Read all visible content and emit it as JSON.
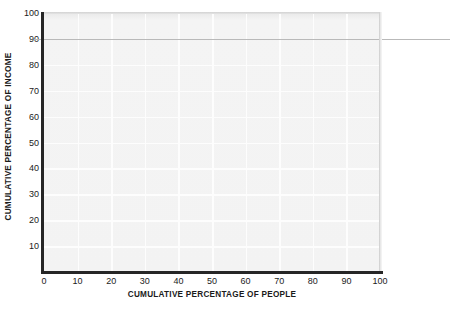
{
  "chart_data": {
    "type": "line",
    "title": "",
    "subtitle": "",
    "xlabel": "CUMULATIVE PERCENTAGE OF PEOPLE",
    "ylabel": "CUMULATIVE PERCENTAGE OF INCOME",
    "xlim": [
      0,
      100
    ],
    "ylim": [
      0,
      100
    ],
    "x_ticks": [
      0,
      10,
      20,
      30,
      40,
      50,
      60,
      70,
      80,
      90,
      100
    ],
    "y_ticks": [
      10,
      20,
      30,
      40,
      50,
      60,
      70,
      80,
      90,
      100
    ],
    "x_tick_labels": [
      "0",
      "10",
      "20",
      "30",
      "40",
      "50",
      "60",
      "70",
      "80",
      "90",
      "100"
    ],
    "y_tick_labels": [
      "10",
      "20",
      "30",
      "40",
      "50",
      "60",
      "70",
      "80",
      "90",
      "100"
    ],
    "grid": true,
    "legend": null,
    "legend_position": "none",
    "series": [],
    "annotations": [
      {
        "name": "reference-line-90",
        "type": "horizontal-line",
        "value": 90,
        "label": "",
        "color": "#b9b9b9"
      }
    ]
  },
  "colors": {
    "axis": "#262626",
    "plot_background": "#f3f3f3",
    "gridline": "#fdfdfd",
    "reference_line": "#b9b9b9",
    "text": "#1b1b1b",
    "page_background": "#ffffff"
  }
}
